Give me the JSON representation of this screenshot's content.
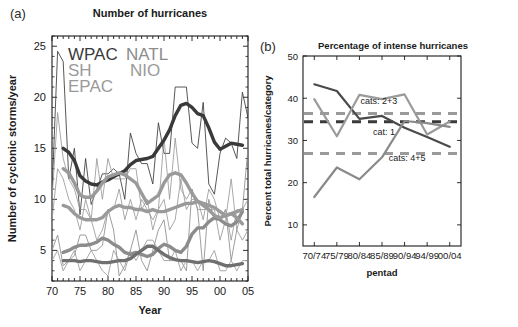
{
  "figure": {
    "panel_a_label": "(a)",
    "panel_b_label": "(b)"
  },
  "panel_a": {
    "title": "Number of hurricanes",
    "xlabel": "Year",
    "ylabel": "Number of cyclonic storms/year",
    "xticks": [
      "70",
      "75",
      "80",
      "85",
      "90",
      "95",
      "00",
      "05"
    ],
    "yticks": [
      "5",
      "10",
      "15",
      "20",
      "25"
    ],
    "legend": [
      {
        "name": "WPAC",
        "color": "#3a3a3a"
      },
      {
        "name": "NATL",
        "color": "#8c8c8c"
      },
      {
        "name": "SH",
        "color": "#9a9a9a"
      },
      {
        "name": "NIO",
        "color": "#9a9a9a"
      },
      {
        "name": "EPAC",
        "color": "#9a9a9a"
      }
    ]
  },
  "panel_b": {
    "title": "Percentage of intense hurricanes",
    "xlabel": "pentad",
    "ylabel": "Percent  total hurricanes/category",
    "xticks": [
      "70/74",
      "75/79",
      "80/84",
      "85/89",
      "90/94",
      "94/99",
      "00/04"
    ],
    "yticks": [
      "10",
      "20",
      "30",
      "40",
      "50"
    ],
    "annotations": [
      {
        "text": "cats: 2+3",
        "x": 2.05,
        "y": 38.6
      },
      {
        "text": "cat: 1",
        "x": 2.6,
        "y": 31.4
      },
      {
        "text": "cats: 4+5",
        "x": 3.3,
        "y": 25.2
      }
    ]
  },
  "chart_data": [
    {
      "type": "line",
      "panel": "a",
      "title": "Number of hurricanes",
      "xlabel": "Year",
      "ylabel": "Number of cyclonic storms/year",
      "xlim": [
        1970,
        2005
      ],
      "ylim": [
        2,
        26
      ],
      "grid": false,
      "legend_position": "upper-left-inside",
      "x": [
        1970,
        1971,
        1972,
        1973,
        1974,
        1975,
        1976,
        1977,
        1978,
        1979,
        1980,
        1981,
        1982,
        1983,
        1984,
        1985,
        1986,
        1987,
        1988,
        1989,
        1990,
        1991,
        1992,
        1993,
        1994,
        1995,
        1996,
        1997,
        1998,
        1999,
        2000,
        2001,
        2002,
        2003,
        2004,
        2005
      ],
      "series": [
        {
          "name": "WPAC",
          "color": "#3a3a3a",
          "style": "thin-annual",
          "values": [
            10.5,
            24.5,
            23.5,
            12.0,
            15.0,
            8.5,
            14.0,
            9.5,
            11.0,
            12.5,
            12.5,
            13.0,
            12.5,
            10.0,
            16.5,
            14.5,
            13.5,
            13.5,
            11.5,
            17.5,
            14.5,
            14.5,
            21.0,
            21.0,
            21.0,
            15.5,
            15.0,
            19.5,
            11.5,
            10.5,
            14.5,
            16.0,
            15.5,
            14.0,
            20.5,
            18.0
          ]
        },
        {
          "name": "WPAC-smoothed",
          "color": "#3a3a3a",
          "style": "thick-smooth",
          "values": [
            null,
            null,
            15.0,
            14.6,
            13.8,
            12.3,
            11.8,
            11.5,
            11.4,
            11.7,
            11.9,
            12.2,
            12.5,
            12.8,
            13.4,
            13.8,
            13.9,
            14.0,
            14.2,
            15.0,
            15.8,
            16.8,
            18.2,
            19.2,
            19.4,
            19.0,
            18.4,
            18.2,
            17.0,
            15.6,
            14.9,
            15.2,
            15.5,
            15.4,
            15.3,
            null
          ]
        },
        {
          "name": "NATL",
          "color": "#8c8c8c",
          "style": "thin-annual",
          "values": [
            5.0,
            6.5,
            3.5,
            4.0,
            4.5,
            6.5,
            6.5,
            5.0,
            5.0,
            5.5,
            9.0,
            7.0,
            2.5,
            3.5,
            5.0,
            7.0,
            4.0,
            3.0,
            5.0,
            7.0,
            8.0,
            4.0,
            4.0,
            4.0,
            3.0,
            11.0,
            9.0,
            3.0,
            10.0,
            8.0,
            8.0,
            9.0,
            4.0,
            7.0,
            9.0,
            15.0
          ]
        },
        {
          "name": "NATL-smoothed",
          "color": "#8c8c8c",
          "style": "thick-smooth",
          "values": [
            null,
            null,
            4.8,
            5.0,
            5.3,
            5.5,
            5.5,
            5.6,
            5.8,
            6.2,
            6.0,
            5.6,
            5.3,
            4.8,
            4.6,
            4.8,
            4.6,
            4.4,
            4.6,
            5.2,
            5.6,
            5.4,
            5.0,
            4.8,
            5.4,
            6.6,
            7.2,
            7.2,
            7.8,
            8.2,
            8.0,
            7.6,
            7.4,
            7.8,
            8.8,
            null
          ]
        },
        {
          "name": "EPAC",
          "color": "#9a9a9a",
          "style": "thin-annual",
          "values": [
            10.0,
            18.5,
            14.0,
            12.0,
            11.0,
            9.0,
            9.0,
            8.0,
            14.0,
            10.0,
            14.0,
            12.0,
            12.0,
            12.0,
            13.0,
            13.0,
            9.0,
            10.0,
            7.0,
            9.0,
            16.0,
            10.0,
            16.0,
            11.0,
            10.0,
            11.0,
            9.0,
            9.0,
            9.0,
            9.0,
            6.0,
            8.0,
            12.0,
            7.0,
            6.0,
            7.0
          ]
        },
        {
          "name": "EPAC-smoothed",
          "color": "#9a9a9a",
          "style": "thick-smooth",
          "values": [
            null,
            null,
            13.0,
            12.6,
            11.6,
            10.4,
            10.2,
            10.2,
            10.8,
            11.6,
            12.2,
            12.4,
            12.6,
            12.4,
            12.0,
            11.6,
            10.6,
            9.6,
            10.0,
            10.4,
            11.6,
            12.4,
            12.6,
            12.4,
            11.6,
            10.6,
            9.8,
            9.4,
            9.0,
            8.4,
            8.2,
            8.4,
            8.6,
            8.2,
            7.6,
            null
          ]
        },
        {
          "name": "SH",
          "color": "#9a9a9a",
          "style": "thin-annual",
          "values": [
            8.0,
            13.0,
            12.0,
            10.0,
            9.0,
            7.0,
            10.0,
            8.0,
            6.0,
            7.0,
            9.0,
            9.0,
            11.0,
            8.0,
            10.0,
            8.0,
            10.0,
            9.0,
            8.0,
            9.0,
            10.0,
            7.0,
            8.0,
            12.0,
            9.0,
            10.0,
            10.0,
            8.0,
            11.0,
            10.0,
            8.0,
            9.0,
            6.0,
            9.0,
            9.0,
            10.0
          ]
        },
        {
          "name": "SH-smoothed",
          "color": "#9a9a9a",
          "style": "thick-smooth",
          "values": [
            null,
            null,
            9.4,
            9.2,
            8.6,
            8.2,
            8.0,
            8.0,
            8.0,
            8.2,
            8.8,
            9.2,
            9.4,
            9.2,
            9.2,
            9.0,
            9.0,
            8.8,
            9.0,
            8.8,
            8.8,
            9.0,
            9.2,
            9.4,
            9.6,
            9.6,
            9.8,
            9.6,
            9.4,
            9.2,
            8.8,
            8.4,
            8.6,
            8.8,
            9.0,
            null
          ]
        },
        {
          "name": "NIO",
          "color": "#9a9a9a",
          "style": "thin-annual",
          "values": [
            4.0,
            5.0,
            3.0,
            4.0,
            5.0,
            3.0,
            4.0,
            5.0,
            4.0,
            3.0,
            2.5,
            5.0,
            4.0,
            3.0,
            5.0,
            4.0,
            5.0,
            6.0,
            6.0,
            5.0,
            4.0,
            4.0,
            5.0,
            3.0,
            4.0,
            4.0,
            3.0,
            4.0,
            4.0,
            5.0,
            3.0,
            3.0,
            4.0,
            3.0,
            4.0,
            4.0
          ]
        },
        {
          "name": "NIO-smoothed",
          "color": "#6f6f6f",
          "style": "thick-smooth",
          "values": [
            null,
            null,
            4.0,
            4.0,
            4.0,
            3.9,
            4.0,
            4.0,
            3.9,
            3.8,
            3.8,
            3.9,
            4.0,
            4.0,
            4.2,
            4.6,
            5.0,
            5.4,
            5.4,
            5.0,
            4.6,
            4.3,
            4.1,
            4.0,
            4.0,
            3.9,
            3.8,
            3.9,
            4.0,
            3.9,
            3.7,
            3.5,
            3.5,
            3.6,
            3.7,
            null
          ]
        }
      ]
    },
    {
      "type": "line",
      "panel": "b",
      "title": "Percentage of intense hurricanes",
      "xlabel": "pentad",
      "ylabel": "Percent  total hurricanes/category",
      "categories": [
        "70/74",
        "75/79",
        "80/84",
        "85/89",
        "90/94",
        "94/99",
        "00/04"
      ],
      "ylim": [
        5,
        50
      ],
      "grid": false,
      "legend_position": "inline-annotations",
      "series": [
        {
          "name": "cat: 1",
          "color": "#4a4a4a",
          "style": "solid",
          "values": [
            43.3,
            41.7,
            35.1,
            35.8,
            33.0,
            30.8,
            28.5
          ]
        },
        {
          "name": "cats: 2+3",
          "color": "#9a9a9a",
          "style": "solid",
          "values": [
            39.8,
            31.0,
            40.8,
            39.8,
            40.9,
            31.4,
            34.5
          ]
        },
        {
          "name": "cats: 4+5",
          "color": "#8a8a8a",
          "style": "solid",
          "values": [
            16.6,
            23.6,
            20.8,
            26.0,
            34.6,
            34.1,
            33.2
          ]
        },
        {
          "name": "cat: 1 mean",
          "color": "#3a3a3a",
          "style": "dashed",
          "values": [
            34.4,
            34.4,
            34.4,
            34.4,
            34.4,
            34.4,
            34.4
          ]
        },
        {
          "name": "cats: 2+3 mean",
          "color": "#9a9a9a",
          "style": "dashed",
          "values": [
            36.4,
            36.4,
            36.4,
            36.4,
            36.4,
            36.4,
            36.4
          ]
        },
        {
          "name": "cats: 4+5 mean",
          "color": "#9a9a9a",
          "style": "dashed",
          "values": [
            26.9,
            26.9,
            26.9,
            26.9,
            26.9,
            26.9,
            26.9
          ]
        }
      ]
    }
  ]
}
